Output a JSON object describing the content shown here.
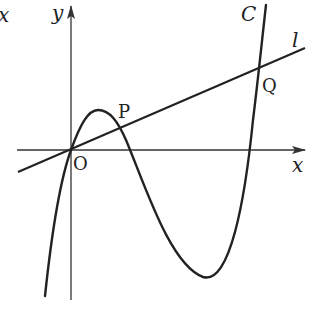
{
  "diagram": {
    "type": "function graph with secant line",
    "labels": {
      "y_axis": "y",
      "x_axis": "x",
      "origin": "O",
      "curve": "C",
      "line": "l",
      "point_p": "P",
      "point_q": "Q",
      "stray_top_left": "x"
    },
    "colors": {
      "stroke": "#222222",
      "axis": "#333333",
      "background": "#ffffff"
    },
    "elements": [
      {
        "id": "x-axis",
        "kind": "axis",
        "direction": "horizontal"
      },
      {
        "id": "y-axis",
        "kind": "axis",
        "direction": "vertical"
      },
      {
        "id": "curve-C",
        "kind": "cubic curve",
        "passes_through": [
          "O",
          "P",
          "Q"
        ]
      },
      {
        "id": "line-l",
        "kind": "straight line",
        "passes_through": [
          "O",
          "P",
          "Q"
        ]
      }
    ]
  }
}
